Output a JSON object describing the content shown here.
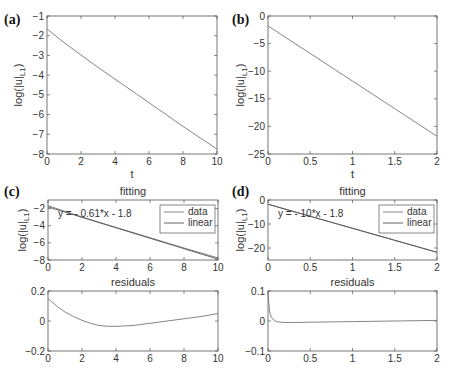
{
  "chart_data": [
    {
      "panel": "(a)",
      "type": "line",
      "title": "",
      "xlabel": "t",
      "ylabel": "log(|u|_L1)",
      "xlim": [
        0,
        10
      ],
      "ylim": [
        -8,
        -1
      ],
      "xticks": [
        "0",
        "2",
        "4",
        "6",
        "8",
        "10"
      ],
      "yticks": [
        "-1",
        "-2",
        "-3",
        "-4",
        "-5",
        "-6",
        "-7",
        "-8"
      ],
      "series": [
        {
          "name": "log(|u|_L1)",
          "x": [
            0,
            1,
            2,
            3,
            4,
            6,
            8,
            10
          ],
          "y": [
            -1.65,
            -2.35,
            -2.98,
            -3.6,
            -4.2,
            -5.4,
            -6.6,
            -7.75
          ]
        }
      ],
      "grid": false
    },
    {
      "panel": "(b)",
      "type": "line",
      "title": "",
      "xlabel": "t",
      "ylabel": "log(|u|_L1)",
      "xlim": [
        0,
        2
      ],
      "ylim": [
        -25,
        0
      ],
      "xticks": [
        "0",
        "0.5",
        "1",
        "1.5",
        "2"
      ],
      "yticks": [
        "0",
        "-5",
        "-10",
        "-15",
        "-20",
        "-25"
      ],
      "series": [
        {
          "name": "log(|u|_L1)",
          "x": [
            0,
            0.5,
            1,
            1.5,
            2
          ],
          "y": [
            -1.8,
            -6.8,
            -11.8,
            -16.8,
            -21.8
          ]
        }
      ],
      "grid": false
    },
    {
      "panel": "(c)",
      "type": "line",
      "title": "fitting",
      "xlabel": "",
      "ylabel": "log(|u|_L1)",
      "xlim": [
        0,
        10
      ],
      "ylim": [
        -8,
        -1
      ],
      "xticks": [
        "0",
        "2",
        "4",
        "6",
        "8",
        "10"
      ],
      "yticks": [
        "-2",
        "-4",
        "-6",
        "-8"
      ],
      "annotation": "y = - 0.61*x - 1.8",
      "legend": [
        "data",
        "linear"
      ],
      "legend_position": "upper right",
      "series": [
        {
          "name": "data",
          "x": [
            0,
            2,
            4,
            6,
            8,
            10
          ],
          "y": [
            -1.65,
            -2.98,
            -4.2,
            -5.4,
            -6.6,
            -7.75
          ]
        },
        {
          "name": "linear",
          "x": [
            0,
            10
          ],
          "y": [
            -1.8,
            -7.9
          ]
        }
      ]
    },
    {
      "panel": "(c)",
      "type": "line",
      "title": "residuals",
      "xlim": [
        0,
        10
      ],
      "ylim": [
        -0.2,
        0.2
      ],
      "xticks": [
        "0",
        "2",
        "4",
        "6",
        "8",
        "10"
      ],
      "yticks": [
        "0.2",
        "0",
        "-0.2"
      ],
      "series": [
        {
          "name": "residuals",
          "x": [
            0,
            0.5,
            1,
            1.5,
            2,
            2.5,
            3,
            3.5,
            4,
            5,
            6,
            7,
            8,
            9,
            10
          ],
          "y": [
            0.15,
            0.1,
            0.06,
            0.03,
            0.005,
            -0.015,
            -0.03,
            -0.035,
            -0.035,
            -0.03,
            -0.015,
            0.0,
            0.015,
            0.03,
            0.05
          ]
        }
      ]
    },
    {
      "panel": "(d)",
      "type": "line",
      "title": "fitting",
      "xlabel": "",
      "ylabel": "log(|u|_L1)",
      "xlim": [
        0,
        2
      ],
      "ylim": [
        -25,
        0
      ],
      "xticks": [
        "0",
        "0.5",
        "1",
        "1.5",
        "2"
      ],
      "yticks": [
        "0",
        "-10",
        "-20"
      ],
      "annotation": "y = - 10*x - 1.8",
      "legend": [
        "data",
        "linear"
      ],
      "legend_position": "upper right",
      "series": [
        {
          "name": "data",
          "x": [
            0,
            0.5,
            1,
            1.5,
            2
          ],
          "y": [
            -1.7,
            -6.8,
            -11.8,
            -16.8,
            -21.8
          ]
        },
        {
          "name": "linear",
          "x": [
            0,
            2
          ],
          "y": [
            -1.8,
            -21.8
          ]
        }
      ]
    },
    {
      "panel": "(d)",
      "type": "line",
      "title": "residuals",
      "xlim": [
        0,
        2
      ],
      "ylim": [
        -0.1,
        0.1
      ],
      "xticks": [
        "0",
        "0.5",
        "1",
        "1.5",
        "2"
      ],
      "yticks": [
        "0.1",
        "0",
        "-0.1"
      ],
      "series": [
        {
          "name": "residuals",
          "x": [
            0,
            0.01,
            0.02,
            0.04,
            0.07,
            0.1,
            0.15,
            0.2,
            0.3,
            0.5,
            1,
            1.5,
            2
          ],
          "y": [
            0.1,
            0.06,
            0.03,
            0.012,
            0.003,
            -0.002,
            -0.004,
            -0.005,
            -0.005,
            -0.004,
            -0.002,
            0.0,
            0.002
          ]
        }
      ]
    }
  ],
  "panel_labels": [
    "(a)",
    "(b)",
    "(c)",
    "(d)"
  ]
}
